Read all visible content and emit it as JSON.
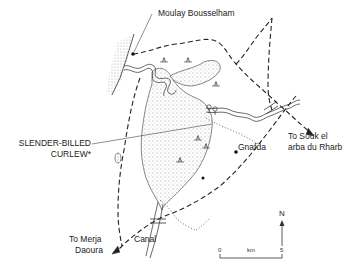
{
  "map": {
    "colors": {
      "ink": "#222222",
      "stipple": "#bdbdbd",
      "background": "#ffffff"
    },
    "labels": {
      "town_north": "Moulay Bousselham",
      "town_east": "Gnafda",
      "road_east_line1": "To Souk el",
      "road_east_line2": "arba du Rharb",
      "species_line1": "SLENDER-BILLED",
      "species_line2": "CURLEW*",
      "road_south_line1": "To Merja",
      "road_south_line2": "Daoura",
      "canal": "Canal"
    },
    "north_arrow": {
      "label": "N"
    },
    "scale_bar": {
      "start": "0",
      "unit": "km",
      "end": "5"
    },
    "symbols": [
      "marsh-vegetation-icon",
      "tree-icon",
      "town-dot-icon"
    ]
  }
}
